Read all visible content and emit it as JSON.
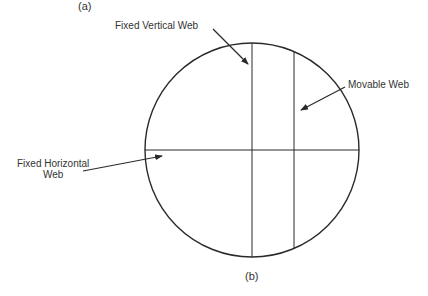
{
  "captions": {
    "top": "(a)",
    "bottom": "(b)"
  },
  "labels": {
    "fixed_vertical": "Fixed Vertical Web",
    "movable": "Movable Web",
    "fixed_horizontal_line1": "Fixed Horizontal",
    "fixed_horizontal_line2": "Web"
  },
  "colors": {
    "stroke": "#2a2a2a",
    "background": "#ffffff"
  }
}
